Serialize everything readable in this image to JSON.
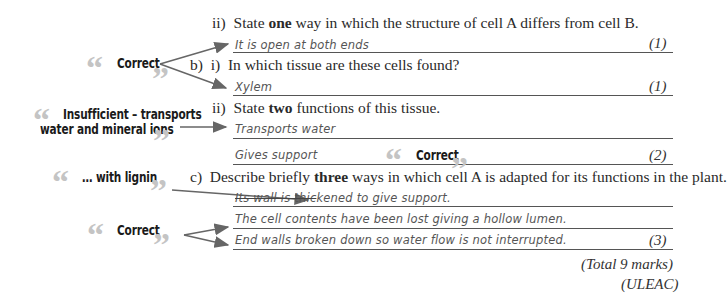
{
  "questions": {
    "q_a_ii": {
      "number": "ii)",
      "pre": "State ",
      "bold": "one",
      "post": " way in which the structure of cell A differs from cell B."
    },
    "q_b_i": {
      "part": "b)",
      "number": "i)",
      "text": "In which tissue are these cells found?"
    },
    "q_b_ii": {
      "number": "ii)",
      "pre": "State ",
      "bold": "two",
      "post": " functions of this tissue."
    },
    "q_c": {
      "part": "c)",
      "pre": "Describe briefly ",
      "bold": "three",
      "post": " ways in which cell A is adapted for its functions in the plant."
    }
  },
  "answers": {
    "a_ii": "It is open at both ends",
    "b_i": "Xylem",
    "b_ii_1": "Transports water",
    "b_ii_2": "Gives support",
    "c_1_struck": "Its wall is thic",
    "c_1_rest": "kened to give support.",
    "c_2": "The cell contents have been lost giving a hollow lumen.",
    "c_3": "End walls broken down so water flow is not interrupted."
  },
  "marks": {
    "a_ii": "(1)",
    "b_i": "(1)",
    "b_ii": "(2)",
    "c": "(3)",
    "total": "(Total 9 marks)",
    "board": "(ULEAC)"
  },
  "comments": {
    "c1": "Correct",
    "c2_line1": "Insufficient – transports",
    "c2_line2": "water and mineral ions",
    "c3": "Correct",
    "c4": "… with lignin",
    "c5": "Correct"
  },
  "quote_glyphs": {
    "open": "“",
    "close": "”"
  },
  "colors": {
    "quote": "#c4c4c4",
    "arrow": "#666666",
    "rule": "#555555"
  }
}
